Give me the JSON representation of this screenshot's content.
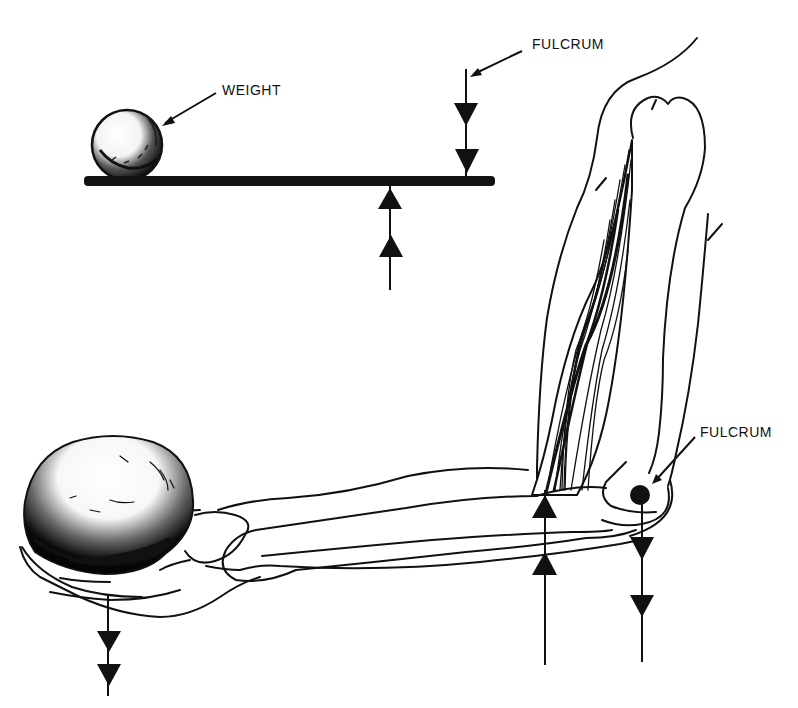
{
  "diagram": {
    "type": "lever-mechanics-illustration",
    "colors": {
      "ink": "#111111",
      "paper": "#ffffff"
    },
    "top_lever": {
      "labels": {
        "weight": "WEIGHT",
        "fulcrum": "FULCRUM"
      },
      "components": [
        "weight-ball",
        "lever-bar",
        "fulcrum-downward-arrows",
        "effort-upward-arrows"
      ]
    },
    "arm": {
      "labels": {
        "fulcrum": "FULCRUM"
      },
      "components": [
        "upper-arm",
        "biceps-muscle",
        "humerus-bone",
        "forearm",
        "hand",
        "held-ball",
        "elbow-joint-dot",
        "load-downward-arrows",
        "muscle-upward-arrows",
        "joint-downward-arrows"
      ]
    }
  }
}
